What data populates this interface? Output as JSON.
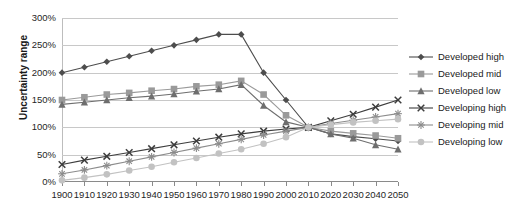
{
  "chart_data": {
    "type": "line",
    "title": "",
    "xlabel": "",
    "ylabel": "Uncertainty range",
    "x": [
      1900,
      1910,
      1920,
      1930,
      1940,
      1950,
      1960,
      1970,
      1980,
      1990,
      2000,
      2010,
      2020,
      2030,
      2040,
      2050
    ],
    "xtick_labels": [
      "1900",
      "1910",
      "1920",
      "1930",
      "1940",
      "1950",
      "1960",
      "1970",
      "1980",
      "1990",
      "2000",
      "2010",
      "2020",
      "2030",
      "2040",
      "2050"
    ],
    "ytick_labels": [
      "0%",
      "50%",
      "100%",
      "150%",
      "200%",
      "250%",
      "300%"
    ],
    "ytick_values": [
      0,
      50,
      100,
      150,
      200,
      250,
      300
    ],
    "ylim": [
      0,
      300
    ],
    "xlim": [
      1900,
      2050
    ],
    "grid": true,
    "legend_position": "right",
    "series": [
      {
        "name": "Developed high",
        "marker": "diamond",
        "color": "#4d4d4d",
        "values": [
          200,
          210,
          220,
          230,
          240,
          250,
          260,
          270,
          270,
          200,
          150,
          100,
          88,
          83,
          79,
          75
        ]
      },
      {
        "name": "Developed mid",
        "marker": "square",
        "color": "#9a9a9a",
        "values": [
          150,
          155,
          160,
          163,
          167,
          170,
          175,
          178,
          185,
          160,
          122,
          100,
          93,
          89,
          85,
          80
        ]
      },
      {
        "name": "Developed low",
        "marker": "triangle",
        "color": "#6e6e6e",
        "values": [
          142,
          146,
          150,
          154,
          157,
          161,
          166,
          170,
          178,
          140,
          110,
          100,
          88,
          80,
          68,
          60
        ]
      },
      {
        "name": "Developing high",
        "marker": "x",
        "color": "#3d3d3d",
        "values": [
          32,
          40,
          47,
          54,
          61,
          68,
          75,
          82,
          88,
          93,
          97,
          100,
          112,
          124,
          137,
          150
        ]
      },
      {
        "name": "Developing mid",
        "marker": "asterisk",
        "color": "#8c8c8c",
        "values": [
          15,
          22,
          30,
          38,
          46,
          54,
          62,
          70,
          78,
          86,
          93,
          100,
          107,
          113,
          119,
          125
        ]
      },
      {
        "name": "Developing low",
        "marker": "circle",
        "color": "#c2c2c2",
        "values": [
          3,
          8,
          14,
          21,
          28,
          36,
          44,
          52,
          60,
          70,
          82,
          100,
          105,
          109,
          112,
          115
        ]
      }
    ]
  },
  "legend": {
    "items": [
      {
        "label": "Developed high"
      },
      {
        "label": "Developed mid"
      },
      {
        "label": "Developed low"
      },
      {
        "label": "Developing high"
      },
      {
        "label": "Developing mid"
      },
      {
        "label": "Developing low"
      }
    ]
  }
}
